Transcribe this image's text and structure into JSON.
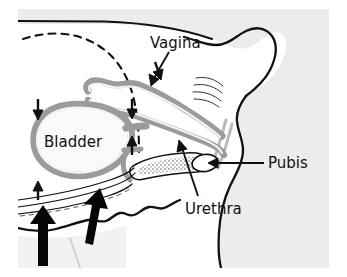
{
  "figure": {
    "type": "anatomical-line-diagram",
    "background_color": "#ffffff",
    "plate_color": "#ececec",
    "ink_color": "#111111",
    "tissue_color": "#9b9b9b",
    "tissue_fill": "#f4f4f4"
  },
  "labels": {
    "vagina": "Vagina",
    "bladder": "Bladder",
    "pubis": "Pubis",
    "urethra": "Urethra"
  },
  "annotations": {
    "downward_pressure_arrows": 3,
    "upward_support_arrows_small": 2,
    "upward_force_arrows_thick": 2,
    "leader_lines": 3
  },
  "structures": [
    {
      "name": "bladder",
      "rendering": "oval-with-thick-gray-wall"
    },
    {
      "name": "vaginal-canal",
      "rendering": "gray-walled-tube"
    },
    {
      "name": "urethra",
      "rendering": "thin-tube-with-stippled-lumen"
    },
    {
      "name": "pubis",
      "rendering": "small-oval-in-cross-section"
    },
    {
      "name": "pelvic-floor",
      "rendering": "jagged-muscle-line"
    },
    {
      "name": "body-contour",
      "rendering": "solid-outline"
    },
    {
      "name": "peritoneum",
      "rendering": "dashed-curve"
    }
  ]
}
